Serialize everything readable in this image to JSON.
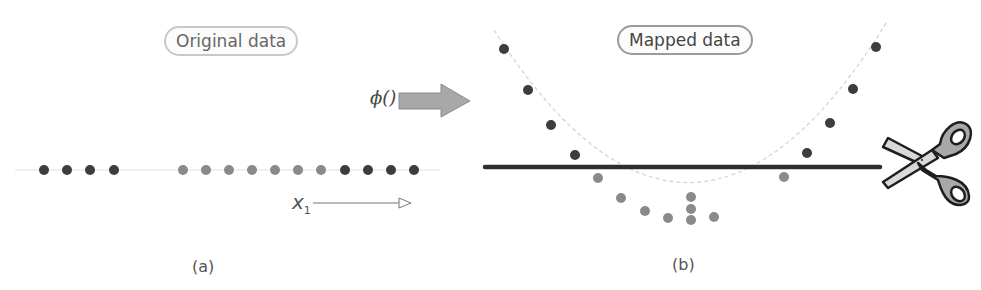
{
  "panel_a": {
    "title": "Original data",
    "caption": "(a)",
    "axis_label": "x",
    "axis_subscript": "1",
    "points": [
      {
        "x": 44,
        "class": "dark"
      },
      {
        "x": 67,
        "class": "dark"
      },
      {
        "x": 90,
        "class": "dark"
      },
      {
        "x": 114,
        "class": "dark"
      },
      {
        "x": 183,
        "class": "light"
      },
      {
        "x": 206,
        "class": "light"
      },
      {
        "x": 229,
        "class": "light"
      },
      {
        "x": 252,
        "class": "light"
      },
      {
        "x": 275,
        "class": "light"
      },
      {
        "x": 298,
        "class": "light"
      },
      {
        "x": 321,
        "class": "light"
      },
      {
        "x": 345,
        "class": "dark"
      },
      {
        "x": 368,
        "class": "dark"
      },
      {
        "x": 391,
        "class": "dark"
      },
      {
        "x": 414,
        "class": "dark"
      }
    ]
  },
  "transform": {
    "label": "ϕ()"
  },
  "panel_b": {
    "title": "Mapped data",
    "caption": "(b)",
    "separator": "decision-line",
    "tool_icon": "scissors-icon"
  },
  "colors": {
    "dark_point": "#3d3d3d",
    "light_point": "#8a8a8a",
    "line": "#2e2e2e",
    "guide": "#dddddd",
    "arrow_fill": "#a8a8a8"
  }
}
